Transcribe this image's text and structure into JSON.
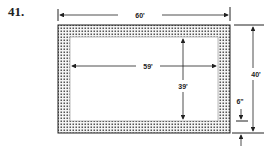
{
  "problem": {
    "number": "41."
  },
  "diagram": {
    "outer_length_label": "60'",
    "inner_length_label": "59'",
    "inner_width_label": "39'",
    "outer_width_label": "40'",
    "border_width_label": "6\""
  },
  "colors": {
    "line": "#222222",
    "dots": "#555555",
    "background": "#ffffff"
  }
}
